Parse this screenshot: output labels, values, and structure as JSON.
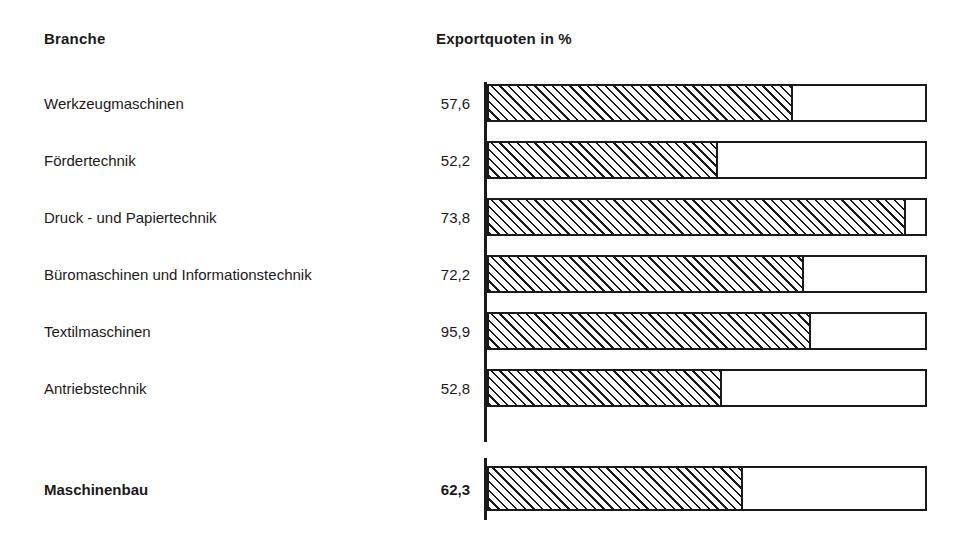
{
  "header": {
    "category_col": "Branche",
    "value_col": "Exportquoten in %"
  },
  "chart_data": {
    "type": "bar",
    "title": "Exportquoten in %",
    "xlabel": "",
    "ylabel": "Branche",
    "xlim": [
      0,
      100
    ],
    "grid": false,
    "legend": "none",
    "orientation": "horizontal",
    "categories": [
      "Werkzeugmaschinen",
      "Fördertechnik",
      "Druck - und Papiertechnik",
      "Büromaschinen und Informationstechnik",
      "Textilmaschinen",
      "Antriebstechnik"
    ],
    "values": [
      57.6,
      52.2,
      73.8,
      72.2,
      95.9,
      52.8
    ],
    "value_labels": [
      "57,6",
      "52,2",
      "73,8",
      "72,2",
      "95,9",
      "52,8"
    ],
    "total": {
      "category": "Maschinenbau",
      "value": 62.3,
      "value_label": "62,3"
    }
  },
  "rows": [
    {
      "label": "Werkzeugmaschinen",
      "value": "57,6",
      "fill_pct": 69.8
    },
    {
      "label": "Fördertechnik",
      "value": "52,2",
      "fill_pct": 52.5
    },
    {
      "label": "Druck - und Papiertechnik",
      "value": "73,8",
      "fill_pct": 95.7
    },
    {
      "label": "Büromaschinen und Informationstechnik",
      "value": "72,2",
      "fill_pct": 72.3
    },
    {
      "label": "Textilmaschinen",
      "value": "95,9",
      "fill_pct": 73.9
    },
    {
      "label": "Antriebstechnik",
      "value": "52,8",
      "fill_pct": 53.4
    }
  ],
  "total_row": {
    "label": "Maschinenbau",
    "value": "62,3",
    "fill_pct": 58.2
  },
  "colors": {
    "ink": "#1a1a1a",
    "paper": "#ffffff"
  }
}
